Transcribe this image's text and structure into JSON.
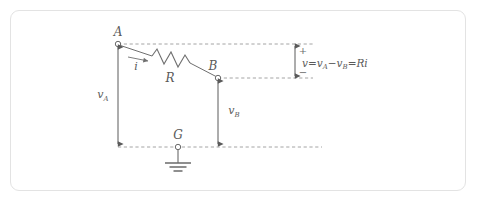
{
  "figure": {
    "background_color": "#ffffff",
    "border_color": "#e3e3e3",
    "line_color": "#6a6a6a",
    "dash_color": "#8a8a8a",
    "text_color": "#5a5a5a"
  },
  "nodes": {
    "a": {
      "label": "A",
      "x": 118,
      "y": 44
    },
    "b": {
      "label": "B",
      "x": 218,
      "y": 78
    },
    "ground": {
      "label": "G",
      "x": 178,
      "y": 147
    }
  },
  "components": {
    "resistor": {
      "label": "R"
    },
    "current": {
      "label": "i"
    }
  },
  "measures": {
    "v_a": {
      "symbol": "v",
      "subscript": "A"
    },
    "v_b": {
      "symbol": "v",
      "subscript": "B"
    },
    "v_drop": {
      "plus": "+",
      "minus": "−",
      "symbol": "v",
      "eq1": "=",
      "term1_symbol": "v",
      "term1_subscript": "A",
      "op": "−",
      "term2_symbol": "v",
      "term2_subscript": "B",
      "eq2": "=",
      "result": "Ri",
      "full_text": "v=v_A−v_B=Ri"
    }
  }
}
